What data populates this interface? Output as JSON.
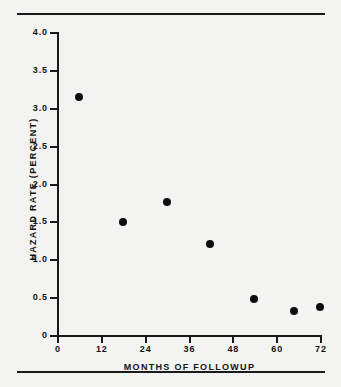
{
  "figure": {
    "background_color": "#f3f3f1",
    "ink_color": "#141414",
    "top_rule": "horizontal-rule",
    "bottom_rule": "horizontal-rule"
  },
  "chart_data": {
    "type": "scatter",
    "title": "",
    "subtitle": "",
    "xlabel": "MONTHS OF FOLLOWUP",
    "ylabel": "HAZARD RATE (PERCENT)",
    "xlim": [
      0,
      74
    ],
    "ylim": [
      0,
      4.0
    ],
    "xticks": [
      0,
      12,
      24,
      36,
      48,
      60,
      72
    ],
    "xticklabels": [
      "0",
      "12",
      "24",
      "36",
      "48",
      "60",
      "72"
    ],
    "yticks": [
      0,
      0.5,
      1.0,
      1.5,
      2.0,
      2.5,
      3.0,
      3.5,
      4.0
    ],
    "yticklabels": [
      "0",
      "0.5",
      "1.0",
      "1.5",
      "2.0",
      "2.5",
      "3.0",
      "3.5",
      "4.0"
    ],
    "grid": false,
    "legend": false,
    "legend_position": "none",
    "marker": "filled-circle",
    "marker_color": "#0d0d0d",
    "x": [
      6,
      18,
      30,
      42,
      54,
      65,
      72
    ],
    "y": [
      3.15,
      1.51,
      1.77,
      1.21,
      0.49,
      0.33,
      0.38
    ],
    "points": [
      {
        "x": 6,
        "y": 3.15
      },
      {
        "x": 18,
        "y": 1.51
      },
      {
        "x": 30,
        "y": 1.77
      },
      {
        "x": 42,
        "y": 1.21
      },
      {
        "x": 54,
        "y": 0.49
      },
      {
        "x": 65,
        "y": 0.33
      },
      {
        "x": 72,
        "y": 0.38
      }
    ],
    "annotations": []
  }
}
